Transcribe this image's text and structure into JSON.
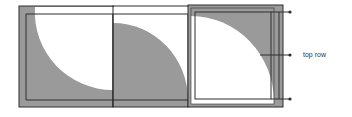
{
  "diagram": {
    "title": "",
    "colors": {
      "shade": "#9a9a9a",
      "frame": "#2e2e2e",
      "background": "#ffffff",
      "text": "#333333"
    },
    "panels": [
      {
        "id": "panel-1",
        "description": "grey square with white concave quarter-circle cut from top-right",
        "shape": "concave-quarter"
      },
      {
        "id": "panel-2",
        "description": "white square with grey convex quarter-disc from bottom-left",
        "shape": "convex-quarter"
      },
      {
        "id": "panel-3",
        "description": "grey square with white convex quarter-disc from bottom-left",
        "shape": "convex-quarter-inverse"
      }
    ],
    "bracket": {
      "ticks": 3,
      "label": "top row"
    }
  }
}
